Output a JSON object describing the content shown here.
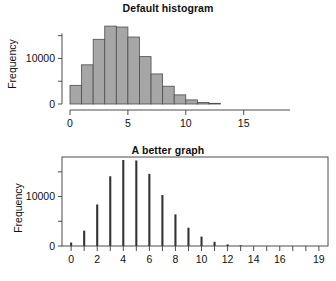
{
  "figure": {
    "background": "#ffffff",
    "axis_color": "#4d4d4d",
    "bar_fill": "#a6a6a6",
    "bar_stroke": "#4d4d4d",
    "spike_color": "#333333",
    "text_color": "#111111"
  },
  "panels": {
    "top": {
      "title": "Default histogram",
      "ylabel": "Frequency",
      "ytick_labels": [
        "0",
        "10000"
      ],
      "xtick_labels": [
        "0",
        "5",
        "10",
        "15"
      ]
    },
    "bottom": {
      "title": "A better graph",
      "ylabel": "Frequency",
      "ytick_labels": [
        "0",
        "10000"
      ],
      "xtick_labels": [
        "0",
        "2",
        "4",
        "6",
        "8",
        "10",
        "12",
        "14",
        "16",
        "19"
      ]
    }
  },
  "chart_data": [
    {
      "type": "bar",
      "title": "Default histogram",
      "xlabel": "",
      "ylabel": "Frequency",
      "xlim": [
        0,
        19
      ],
      "ylim": [
        0,
        18000
      ],
      "grid": false,
      "legend": null,
      "bin_width": 1,
      "bin_edges": [
        0,
        1,
        2,
        3,
        4,
        5,
        6,
        7,
        8,
        9,
        10,
        11,
        12,
        13,
        14,
        15,
        16,
        17,
        18,
        19
      ],
      "categories": [
        "0-1",
        "1-2",
        "2-3",
        "3-4",
        "4-5",
        "5-6",
        "6-7",
        "7-8",
        "8-9",
        "9-10",
        "10-11",
        "11-12",
        "12-13",
        "13-14",
        "14-15",
        "15-16",
        "16-17",
        "17-18",
        "18-19"
      ],
      "values": [
        4100,
        8600,
        14200,
        17100,
        16900,
        14700,
        10400,
        6600,
        3900,
        2000,
        900,
        350,
        150,
        60,
        25,
        10,
        5,
        2,
        1
      ],
      "xticks": [
        0,
        5,
        10,
        15
      ],
      "yticks": [
        0,
        10000
      ],
      "yminor_ticks": [
        5000,
        15000
      ]
    },
    {
      "type": "bar",
      "title": "A better graph",
      "xlabel": "",
      "ylabel": "Frequency",
      "xlim": [
        -0.7,
        19.7
      ],
      "ylim": [
        0,
        18000
      ],
      "grid": false,
      "legend": null,
      "style": "spike",
      "categories": [
        "0",
        "1",
        "2",
        "3",
        "4",
        "5",
        "6",
        "7",
        "8",
        "9",
        "10",
        "11",
        "12",
        "13",
        "14",
        "15",
        "16",
        "17",
        "18",
        "19"
      ],
      "values": [
        700,
        3100,
        8400,
        14100,
        17400,
        17300,
        14600,
        10300,
        6400,
        3700,
        1900,
        850,
        330,
        140,
        55,
        22,
        9,
        4,
        2,
        1
      ],
      "xticks": [
        0,
        1,
        2,
        3,
        4,
        5,
        6,
        7,
        8,
        9,
        10,
        11,
        12,
        13,
        14,
        15,
        16,
        17,
        18,
        19
      ],
      "xtick_labeled": [
        0,
        2,
        4,
        6,
        8,
        10,
        12,
        14,
        16,
        19
      ],
      "yticks": [
        0,
        10000
      ],
      "yminor_ticks": [
        5000,
        15000
      ]
    }
  ]
}
